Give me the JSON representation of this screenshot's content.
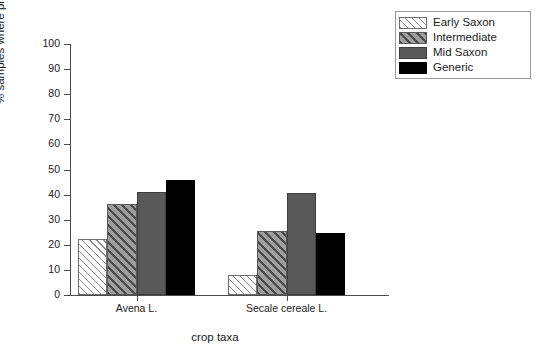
{
  "chart_data": {
    "type": "bar",
    "title": "",
    "xlabel": "crop taxa",
    "ylabel": "% samples where present",
    "categories": [
      "Avena L.",
      "Secale cereale L."
    ],
    "series": [
      {
        "name": "Early Saxon",
        "values": [
          22.3,
          8.0
        ],
        "color": "#ffffff",
        "pattern": "diagonal-hatch-light"
      },
      {
        "name": "Intermediate",
        "values": [
          36.4,
          25.5
        ],
        "color": "#9e9e9e",
        "pattern": "diagonal-hatch-grey"
      },
      {
        "name": "Mid Saxon",
        "values": [
          41.2,
          40.5
        ],
        "color": "#595959",
        "pattern": "solid"
      },
      {
        "name": "Generic",
        "values": [
          45.8,
          24.8
        ],
        "color": "#000000",
        "pattern": "solid"
      }
    ],
    "ylim": [
      0,
      100
    ],
    "ytick_step": 10,
    "yticks": [
      0,
      10,
      20,
      30,
      40,
      50,
      60,
      70,
      80,
      90,
      100
    ],
    "ytick_labels": [
      "0",
      "10",
      "20",
      "30",
      "40",
      "50",
      "60",
      "70",
      "80",
      "90",
      "100"
    ],
    "grid": false,
    "legend_position": "top-right"
  },
  "legend": {
    "entries": [
      {
        "label": "Early Saxon"
      },
      {
        "label": "Intermediate"
      },
      {
        "label": "Mid Saxon"
      },
      {
        "label": "Generic"
      }
    ]
  }
}
